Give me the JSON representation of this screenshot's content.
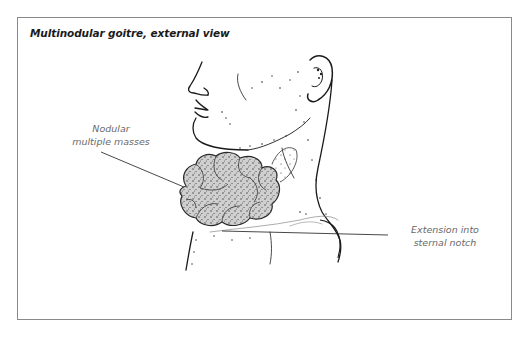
{
  "figure": {
    "title": "Multinodular goitre, external view",
    "labels": {
      "nodular_line1": "Nodular",
      "nodular_line2": "multiple masses",
      "extension_line1": "Extension into",
      "extension_line2": "sternal notch"
    },
    "colors": {
      "frame_border": "#8a8a8a",
      "title_text": "#1a1a1a",
      "label_text": "#6a6a6a",
      "goitre_fill": "#c8c8c8",
      "ink": "#1a1a1a"
    }
  }
}
